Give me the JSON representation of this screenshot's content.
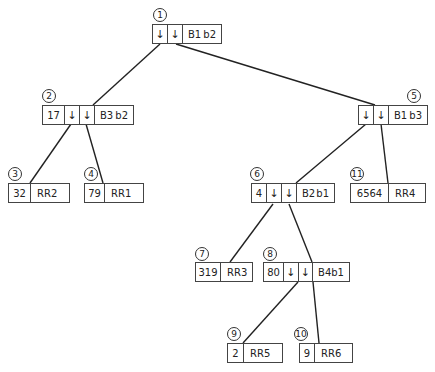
{
  "nodes": {
    "n1": {
      "num": "1",
      "ptr1": "↓",
      "ptr2": "↓",
      "block": "B1",
      "tag": "b2"
    },
    "n2": {
      "num": "2",
      "key": "17",
      "ptr1": "↓",
      "ptr2": "↓",
      "block": "B3",
      "tag": "b2"
    },
    "n3": {
      "num": "3",
      "key": "32",
      "rr": "RR2"
    },
    "n4": {
      "num": "4",
      "key": "79",
      "rr": "RR1"
    },
    "n5": {
      "num": "5",
      "ptr1": "↓",
      "ptr2": "↓",
      "block": "B1",
      "tag": "b3"
    },
    "n6": {
      "num": "6",
      "key": "4",
      "ptr1": "↓",
      "ptr2": "↓",
      "block": "B2",
      "tag": "b1"
    },
    "n7": {
      "num": "7",
      "key": "319",
      "rr": "RR3"
    },
    "n8": {
      "num": "8",
      "key": "80",
      "ptr1": "↓",
      "ptr2": "↓",
      "block": "B4",
      "tag": "b1"
    },
    "n9": {
      "num": "9",
      "key": "2",
      "rr": "RR5"
    },
    "n10": {
      "num": "10",
      "key": "9",
      "rr": "RR6"
    },
    "n11": {
      "num": "11",
      "key": "6564",
      "rr": "RR4"
    }
  }
}
